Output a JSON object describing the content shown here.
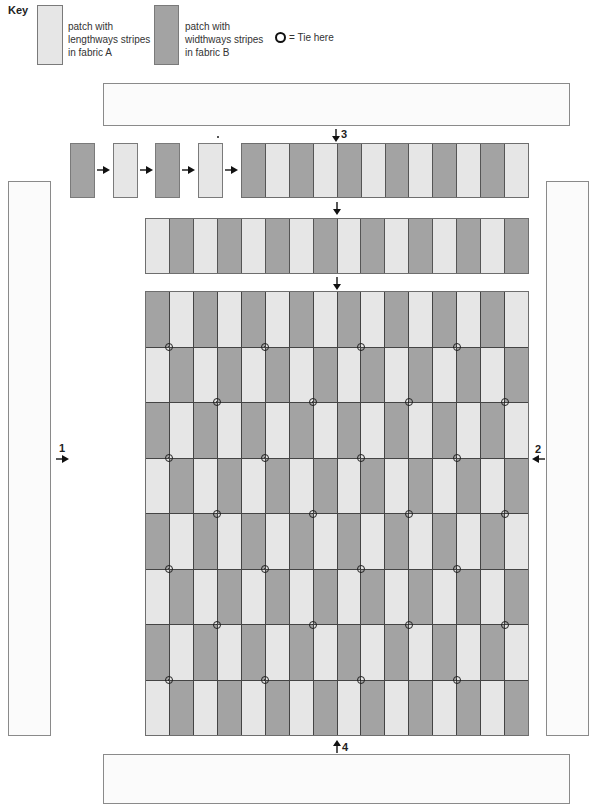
{
  "key": {
    "title": "Key",
    "items": [
      {
        "swatch": "light",
        "label_lines": [
          "patch with",
          "lengthways stripes",
          "in fabric A"
        ]
      },
      {
        "swatch": "dark",
        "label_lines": [
          "patch with",
          "widthways stripes",
          "in fabric B"
        ]
      }
    ],
    "tie_label": "= Tie here"
  },
  "colors": {
    "fabric_a_light": "#e6e6e6",
    "fabric_b_dark": "#a3a3a3",
    "outline": "#6e6e6e",
    "panel_fill": "#fbfbfb"
  },
  "assembly_sequence": [
    "dark",
    "light",
    "dark",
    "light"
  ],
  "first_strip": {
    "columns": 12,
    "start": "dark"
  },
  "second_strip": {
    "columns": 16,
    "start": "light"
  },
  "main_grid": {
    "columns": 16,
    "rows": 8,
    "row_starts": [
      "dark",
      "light",
      "dark",
      "light",
      "dark",
      "light",
      "dark",
      "light"
    ],
    "tie_rows": [
      {
        "boundary": 1,
        "column_boundaries": [
          1,
          5,
          9,
          13
        ]
      },
      {
        "boundary": 2,
        "column_boundaries": [
          3,
          7,
          11,
          15
        ]
      },
      {
        "boundary": 3,
        "column_boundaries": [
          1,
          5,
          9,
          13
        ]
      },
      {
        "boundary": 4,
        "column_boundaries": [
          3,
          7,
          11,
          15
        ]
      },
      {
        "boundary": 5,
        "column_boundaries": [
          1,
          5,
          9,
          13
        ]
      },
      {
        "boundary": 6,
        "column_boundaries": [
          3,
          7,
          11,
          15
        ]
      },
      {
        "boundary": 7,
        "column_boundaries": [
          1,
          5,
          9,
          13
        ]
      }
    ]
  },
  "steps": {
    "step1": "1",
    "step2": "2",
    "step3": "3",
    "step4": "4"
  }
}
